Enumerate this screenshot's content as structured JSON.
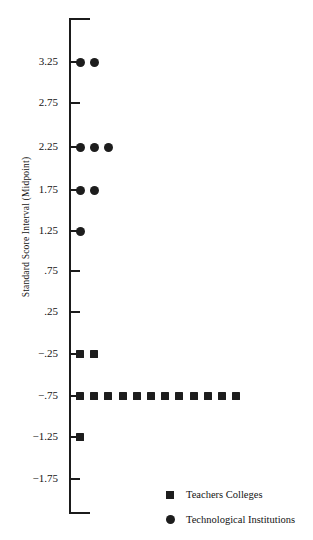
{
  "chart_data": {
    "type": "scatter",
    "title": "",
    "subtitle": "",
    "xlabel": "",
    "ylabel": "Standard Score Interval (Midpoint)",
    "grid": false,
    "legend_position": "bottom-right",
    "orientation": "horizontal-dotplot",
    "ylim": [
      -2.0,
      3.6
    ],
    "yticks": [
      "3.25",
      "2.75",
      "2.25",
      "1.75",
      "1.25",
      ".75",
      ".25",
      "−.25",
      "−.75",
      "−1.25",
      "−1.75"
    ],
    "ytick_values": [
      3.25,
      2.75,
      2.25,
      1.75,
      1.25,
      0.75,
      0.25,
      -0.25,
      -0.75,
      -1.25,
      -1.75
    ],
    "note": "Each marker represents one institution; markers are stacked horizontally within a standard score interval.",
    "series": [
      {
        "name": "Teachers Colleges",
        "marker": "square",
        "color": "#1d1d1d",
        "categories": [
          3.25,
          2.75,
          2.25,
          1.75,
          1.25,
          0.75,
          0.25,
          -0.25,
          -0.75,
          -1.25,
          -1.75
        ],
        "values": [
          0,
          0,
          0,
          0,
          0,
          0,
          0,
          2,
          12,
          1,
          0
        ]
      },
      {
        "name": "Technological Institutions",
        "marker": "circle",
        "color": "#1d1d1d",
        "categories": [
          3.25,
          2.75,
          2.25,
          1.75,
          1.25,
          0.75,
          0.25,
          -0.25,
          -0.75,
          -1.25,
          -1.75
        ],
        "values": [
          2,
          0,
          3,
          2,
          1,
          0,
          0,
          0,
          0,
          0,
          0
        ]
      }
    ]
  },
  "axis": {
    "label": "Standard Score Interval (Midpoint)",
    "ticks": [
      {
        "label": "3.25",
        "y": 62
      },
      {
        "label": "2.75",
        "y": 103
      },
      {
        "label": "2.25",
        "y": 147
      },
      {
        "label": "1.75",
        "y": 190
      },
      {
        "label": "1.25",
        "y": 231
      },
      {
        "label": ".75",
        "y": 271
      },
      {
        "label": ".25",
        "y": 312
      },
      {
        "label": "−.25",
        "y": 354
      },
      {
        "label": "−.75",
        "y": 396
      },
      {
        "label": "−1.25",
        "y": 437
      },
      {
        "label": "−1.75",
        "y": 479
      }
    ]
  },
  "legend": {
    "items": [
      {
        "label": "Teachers Colleges",
        "marker": "square"
      },
      {
        "label": "Technological Institutions",
        "marker": "circle"
      }
    ]
  }
}
